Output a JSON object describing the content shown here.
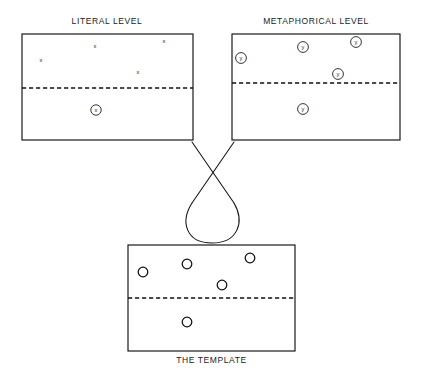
{
  "figure": {
    "type": "conceptual-diagram",
    "background_color": "#ffffff",
    "line_color": "#111111"
  },
  "panels": [
    {
      "id": "literal-level",
      "title": "LITERAL LEVEL",
      "title_x": 107,
      "title_y": 22,
      "rect": {
        "x": 22,
        "y": 34,
        "width": 171,
        "height": 106
      },
      "divider_y": 88,
      "marks": [
        {
          "type": "x-plain",
          "x": 41,
          "y": 61,
          "label": "x"
        },
        {
          "type": "x-plain",
          "x": 95,
          "y": 47,
          "label": "x"
        },
        {
          "type": "x-plain",
          "x": 164,
          "y": 42,
          "label": "x"
        },
        {
          "type": "x-plain",
          "x": 138,
          "y": 73,
          "label": "x"
        },
        {
          "type": "x-circled",
          "x": 96,
          "y": 110,
          "label": "x",
          "radius": 5.2
        }
      ]
    },
    {
      "id": "metaphorical-level",
      "title": "METAPHORICAL LEVEL",
      "title_x": 316,
      "title_y": 22,
      "rect": {
        "x": 232,
        "y": 34,
        "width": 168,
        "height": 106
      },
      "divider_y": 83,
      "marks": [
        {
          "type": "y-circled",
          "x": 241,
          "y": 58,
          "label": "y",
          "radius": 5.4
        },
        {
          "type": "y-circled",
          "x": 303,
          "y": 47,
          "label": "y",
          "radius": 5.4
        },
        {
          "type": "y-circled",
          "x": 356,
          "y": 42,
          "label": "y",
          "radius": 5.4
        },
        {
          "type": "y-circled",
          "x": 338,
          "y": 74,
          "label": "y",
          "radius": 5.4
        },
        {
          "type": "y-circled",
          "x": 303,
          "y": 109,
          "label": "y",
          "radius": 5.4
        }
      ]
    },
    {
      "id": "the-template",
      "title": "THE TEMPLATE",
      "title_x": 211,
      "title_y": 362,
      "rect": {
        "x": 128,
        "y": 245,
        "width": 167,
        "height": 106
      },
      "divider_y": 298,
      "marks": [
        {
          "type": "circle-open",
          "x": 143,
          "y": 272,
          "radius": 4.8
        },
        {
          "type": "circle-open",
          "x": 187,
          "y": 264,
          "radius": 4.8
        },
        {
          "type": "circle-open",
          "x": 250,
          "y": 258,
          "radius": 4.8
        },
        {
          "type": "circle-open",
          "x": 222,
          "y": 285,
          "radius": 4.8
        },
        {
          "type": "circle-open",
          "x": 187,
          "y": 322,
          "radius": 4.8
        }
      ]
    }
  ],
  "connectors": {
    "left_line": {
      "x1": 192,
      "y1": 142,
      "x2": 234,
      "y2": 203
    },
    "right_line": {
      "x1": 234,
      "y1": 142,
      "x2": 192,
      "y2": 203
    },
    "loop_description": "teardrop loop formed where the two connector lines cross",
    "loop_path": "M 192 203 C 180 222, 186 243, 212 243 C 238 243, 245 222, 234 203"
  },
  "labels": {
    "literal": "LITERAL LEVEL",
    "metaphorical": "METAPHORICAL LEVEL",
    "template": "THE TEMPLATE"
  }
}
